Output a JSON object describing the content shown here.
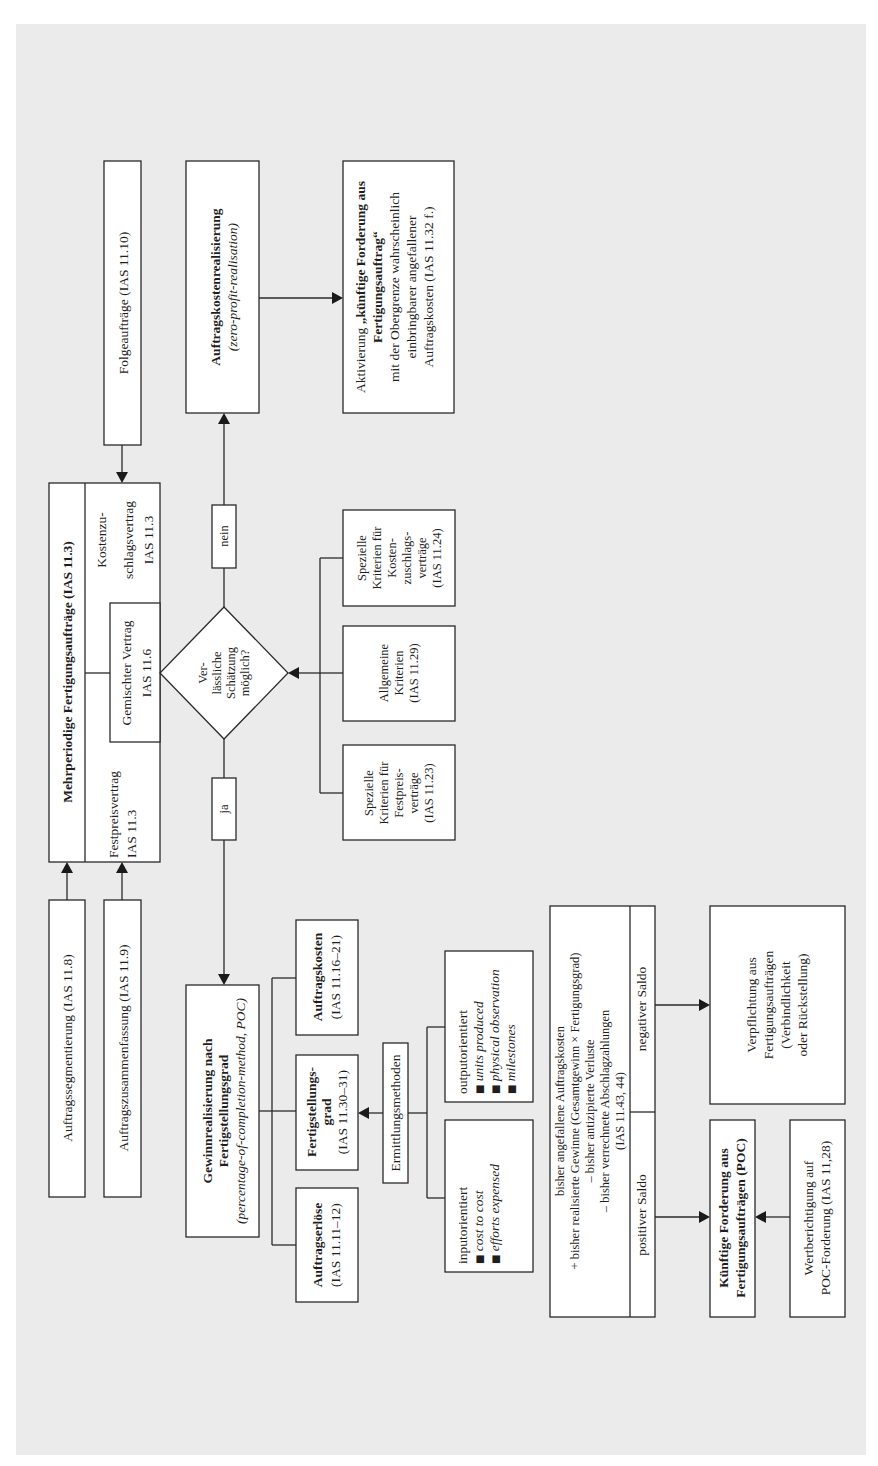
{
  "diagram": {
    "main_contract": {
      "title": "Mehrperiodige Fertigungsaufträge (IAS 11.3)",
      "fixed_price": [
        "Festpreisvertrag",
        "IAS 11.3"
      ],
      "cost_plus": [
        "Kostenzu-",
        "schlagsvertrag",
        "IAS 11.3"
      ],
      "mixed": [
        "Gemischter Vertrag",
        "IAS 11.6"
      ]
    },
    "follow_orders": "Folgeaufträge (IAS 11.10)",
    "segmentation": "Auftragssegmentierung (IAS 11.8)",
    "combination": "Auftragszusammenfassung (IAS 11.9)",
    "decision": {
      "question": [
        "Ver-",
        "lässliche",
        "Schätzung",
        "möglich?"
      ],
      "no_label": "nein",
      "yes_label": "ja"
    },
    "criteria": [
      {
        "lines": [
          "Spezielle",
          "Kriterien für",
          "Kosten-",
          "zuschlags-",
          "verträge",
          "(IAS 11.24)"
        ]
      },
      {
        "lines": [
          "Allgemeine",
          "Kriterien",
          "(IAS 11.29)"
        ]
      },
      {
        "lines": [
          "Spezielle",
          "Kriterien für",
          "Festpreis-",
          "verträge",
          "(IAS 11.23)"
        ]
      }
    ],
    "zero_profit": {
      "title": "Auftragskostenrealisierung",
      "subtitle": "(zero-profit-realisation)"
    },
    "activation": {
      "line1_prefix": "Aktivierung ",
      "line1_bold": "„künftige Forderung aus",
      "line2_bold": "Fertigungsauftrag“",
      "line3": "mit der Obergrenze wahrscheinlich",
      "line4": "einbringbarer angefallener",
      "line5": "Auftragskosten (IAS 11.32 f.)"
    },
    "poc": {
      "title1": "Gewinnrealisierung nach",
      "title2": "Fertigstellungsgrad",
      "subtitle": "(percentage-of-completion-method, POC)"
    },
    "poc_components": {
      "costs": {
        "title": "Auftragskosten",
        "ref": "(IAS 11.16–21)"
      },
      "degree": {
        "title1": "Fertigstellungs-",
        "title2": "grad",
        "ref": "(IAS 11.30–31)"
      },
      "revenue": {
        "title": "Auftragserlöse",
        "ref": "(IAS 11.11–12)"
      }
    },
    "methods": {
      "label": "Ermittlungsmethoden",
      "output": {
        "title": "outputorientiert",
        "items": [
          "units produced",
          "physical observation",
          "milestones"
        ]
      },
      "input": {
        "title": "inputorientiert",
        "items": [
          "cost to cost",
          "efforts expensed"
        ]
      },
      "bullet": "■"
    },
    "saldo": {
      "lines": [
        "bisher angefallene Auftragskosten",
        "+ bisher realisierte Gewinne (Gesamtgewinn × Fertigungsgrad)",
        "– bisher antizipierte Verluste",
        "– bisher verrechnete Abschlagzahlungen",
        "(IAS 11.43, 44)"
      ],
      "negative": "negativer Saldo",
      "positive": "positiver Saldo"
    },
    "liability": {
      "lines": [
        "Verpflichtung aus",
        "Fertigungsaufträgen",
        "(Verbindlichkeit",
        "oder Rückstellung)"
      ]
    },
    "receivable": {
      "lines": [
        "Künftige Forderung aus",
        "Fertigungsaufträgen (POC)"
      ]
    },
    "valuation": {
      "lines": [
        "Wertberichtigung auf",
        "POC-Forderung (IAS 11,28)"
      ]
    }
  }
}
